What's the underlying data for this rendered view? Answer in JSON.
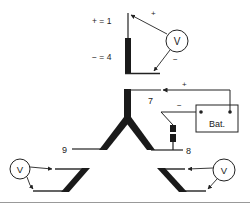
{
  "diagram": {
    "type": "sensor-test-wiring-diagram",
    "top_sensor": {
      "plus_label": "+ = 1",
      "minus_label": "− = 4",
      "voltmeter": {
        "label": "V",
        "plus_sign": "+",
        "minus_sign": "−"
      }
    },
    "y_sensor": {
      "terminal_7": "7",
      "terminal_8": "8",
      "terminal_9": "9",
      "battery": {
        "label": "Bat.",
        "plus_sign": "+",
        "minus_sign": "−"
      }
    },
    "bottom_left_meter": {
      "label": "V"
    },
    "bottom_right_meter": {
      "label": "V"
    }
  },
  "colors": {
    "line": "#222222",
    "thick_bar": "#1a1a1a",
    "border": "#999999",
    "background": "#ffffff"
  }
}
